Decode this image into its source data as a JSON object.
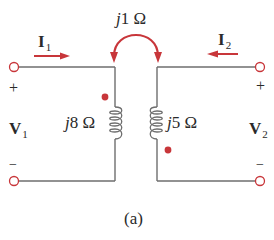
{
  "diagram": {
    "type": "coupled-inductor circuit",
    "caption": "(a)",
    "colors": {
      "wire": "#6e6e6e",
      "accent": "#c8363a",
      "text": "#2a2a2a"
    },
    "mutual": {
      "prefix": "j",
      "value": "1",
      "unit": "Ω"
    },
    "left_inductor": {
      "prefix": "j",
      "value": "8",
      "unit": "Ω"
    },
    "right_inductor": {
      "prefix": "j",
      "value": "5",
      "unit": "Ω"
    },
    "currents": {
      "i1": {
        "symbol": "I",
        "sub": "1",
        "direction": "right"
      },
      "i2": {
        "symbol": "I",
        "sub": "2",
        "direction": "left"
      }
    },
    "voltages": {
      "v1": {
        "symbol": "V",
        "sub": "1",
        "plus": "+",
        "minus": "−"
      },
      "v2": {
        "symbol": "V",
        "sub": "2",
        "plus": "+",
        "minus": "−"
      }
    },
    "dots": [
      {
        "side": "left",
        "position": "top"
      },
      {
        "side": "right",
        "position": "bottom"
      }
    ]
  }
}
